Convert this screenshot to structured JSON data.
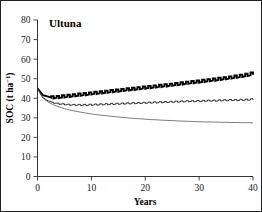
{
  "figure": {
    "panel_label": "Ultuna",
    "background": "#ffffff",
    "border_color": "#222222"
  },
  "axes": {
    "x": {
      "title": "Years",
      "ticks": [
        0,
        10,
        20,
        30,
        40
      ],
      "tick_labels": [
        "0",
        "10",
        "20",
        "30",
        "40"
      ],
      "range": [
        0,
        40
      ]
    },
    "y": {
      "title_main": "SOC (t ha",
      "title_sup": "−1",
      "title_tail": ")",
      "title_full": "SOC (t ha−1)",
      "ticks": [
        0,
        10,
        20,
        30,
        40,
        50,
        60,
        70,
        80
      ],
      "tick_labels": [
        "0",
        "10",
        "20",
        "30",
        "40",
        "50",
        "60",
        "70",
        "80"
      ],
      "range": [
        0,
        80
      ]
    }
  },
  "chart_data": {
    "type": "line",
    "title": "Ultuna",
    "xlabel": "Years",
    "ylabel": "SOC (t ha−1)",
    "xlim": [
      0,
      40
    ],
    "ylim": [
      0,
      80
    ],
    "xticks": [
      0,
      10,
      20,
      30,
      40
    ],
    "yticks": [
      0,
      10,
      20,
      30,
      40,
      50,
      60,
      70,
      80
    ],
    "grid": false,
    "legend": "none",
    "note": "Three simulated soil organic carbon trajectories, all initialised at ~45 t ha-1 at year 0. The two upper series carry an annual sawtooth oscillation (within-year input/decay cycle); the lowest series is a smooth monotonic decline.",
    "x": [
      0,
      1,
      2,
      3,
      4,
      5,
      6,
      7,
      8,
      9,
      10,
      11,
      12,
      13,
      14,
      15,
      16,
      17,
      18,
      19,
      20,
      21,
      22,
      23,
      24,
      25,
      26,
      27,
      28,
      29,
      30,
      31,
      32,
      33,
      34,
      35,
      36,
      37,
      38,
      39,
      40
    ],
    "series": [
      {
        "name": "upper-thick-increasing",
        "style": "thick-black-sawtooth",
        "color": "#000000",
        "linewidth": 1.9,
        "oscillation_amplitude": 0.85,
        "values": [
          45.0,
          41.6,
          40.8,
          40.7,
          40.9,
          41.2,
          41.5,
          41.8,
          42.1,
          42.4,
          42.7,
          43.0,
          43.3,
          43.6,
          43.9,
          44.2,
          44.5,
          44.8,
          45.1,
          45.4,
          45.7,
          46.0,
          46.3,
          46.6,
          46.9,
          47.2,
          47.5,
          47.9,
          48.2,
          48.5,
          48.8,
          49.2,
          49.5,
          49.8,
          50.2,
          50.5,
          50.9,
          51.3,
          51.7,
          52.2,
          52.9
        ]
      },
      {
        "name": "middle-thin-plateau",
        "style": "thin-black-sawtooth",
        "color": "#111111",
        "linewidth": 0.85,
        "oscillation_amplitude": 0.45,
        "values": [
          45.0,
          40.3,
          38.6,
          37.8,
          37.3,
          37.0,
          36.8,
          36.7,
          36.7,
          36.7,
          36.8,
          36.9,
          37.0,
          37.1,
          37.2,
          37.3,
          37.4,
          37.5,
          37.6,
          37.7,
          37.8,
          37.9,
          38.0,
          38.1,
          38.2,
          38.3,
          38.4,
          38.5,
          38.6,
          38.6,
          38.7,
          38.8,
          38.9,
          38.9,
          39.0,
          39.1,
          39.2,
          39.2,
          39.3,
          39.4,
          39.6
        ]
      },
      {
        "name": "lower-smooth-declining",
        "style": "thin-grey-smooth",
        "color": "#5a5a5a",
        "linewidth": 0.8,
        "oscillation_amplitude": 0,
        "values": [
          45.0,
          40.0,
          38.0,
          36.6,
          35.5,
          34.7,
          34.0,
          33.4,
          32.9,
          32.4,
          32.0,
          31.6,
          31.3,
          31.0,
          30.7,
          30.4,
          30.2,
          29.9,
          29.7,
          29.5,
          29.3,
          29.1,
          29.0,
          28.8,
          28.7,
          28.6,
          28.4,
          28.3,
          28.2,
          28.1,
          28.0,
          27.9,
          27.9,
          27.8,
          27.7,
          27.7,
          27.6,
          27.6,
          27.5,
          27.5,
          27.4
        ]
      }
    ]
  }
}
